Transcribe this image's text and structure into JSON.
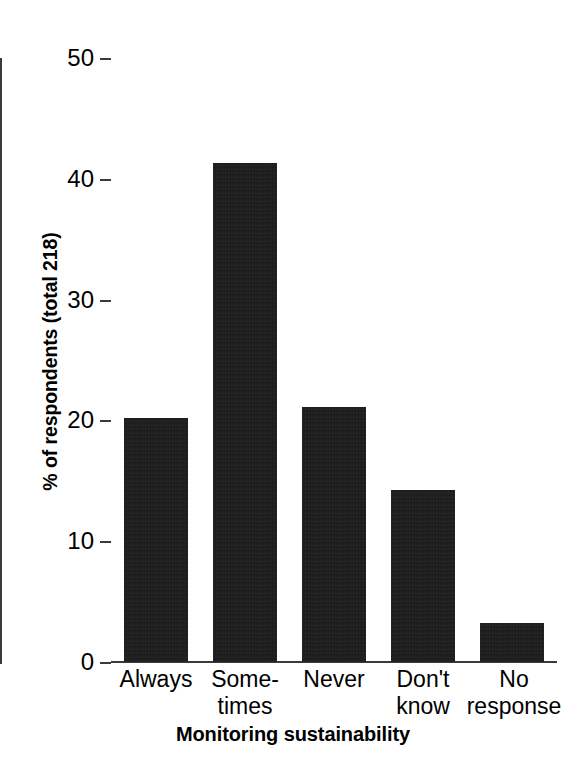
{
  "chart_data": {
    "type": "bar",
    "title": "",
    "xlabel": "Monitoring sustainability",
    "ylabel": "% of respondents (total 218)",
    "categories": [
      "Always",
      "Some-\ntimes",
      "Never",
      "Don't\nknow",
      "No\nresponse"
    ],
    "category_plain": [
      "Always",
      "Sometimes",
      "Never",
      "Don't know",
      "No response"
    ],
    "values": [
      20.2,
      41.3,
      21.1,
      14.2,
      3.2
    ],
    "ylim": [
      0,
      50
    ],
    "yticks": [
      0,
      10,
      20,
      30,
      40,
      50
    ],
    "ytick_labels": [
      "0",
      "10",
      "20",
      "30",
      "40",
      "50"
    ],
    "grid": false,
    "legend": null,
    "bar_color": "#1c1b1b",
    "axis_color": "#3a3a3a",
    "total_respondents": 218
  },
  "axes": {
    "y_title": "% of respondents (total 218)",
    "x_title": "Monitoring sustainability"
  }
}
